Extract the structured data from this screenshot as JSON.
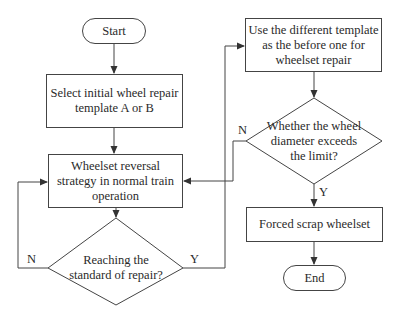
{
  "diagram": {
    "type": "flowchart",
    "nodes": {
      "start": "Start",
      "select_template": [
        "Select initial wheel repair",
        "template A or B"
      ],
      "reversal_strategy": [
        "Wheelset reversal",
        "strategy in normal train",
        "operation"
      ],
      "decision_repair": [
        "Reaching the",
        "standard of repair?"
      ],
      "different_template": [
        "Use the different template",
        "as the before one for",
        "wheelset repair"
      ],
      "decision_diameter": [
        "Whether the wheel",
        "diameter exceeds",
        "the limit?"
      ],
      "scrap": "Forced scrap wheelset",
      "end": "End"
    },
    "edge_labels": {
      "repair_no": "N",
      "repair_yes": "Y",
      "diameter_no": "N",
      "diameter_yes": "Y"
    },
    "colors": {
      "stroke": "#444444",
      "text": "#2a2a2a",
      "background": "#ffffff"
    }
  }
}
